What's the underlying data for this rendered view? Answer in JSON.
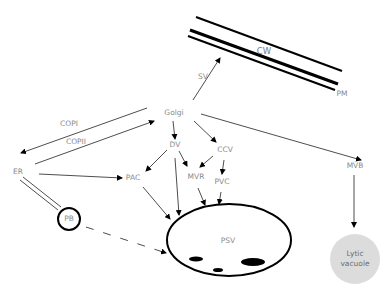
{
  "diagram": {
    "nodes": {
      "cw": "CW",
      "pm": "PM",
      "sv": "SV",
      "golgi": "Golgi",
      "copi": "COPI",
      "copii": "COPII",
      "er": "ER",
      "dv": "DV",
      "ccv": "CCV",
      "pac": "PAC",
      "mvr": "MVR",
      "pvc": "PVC",
      "mvb": "MVB",
      "pb": "PB",
      "psv": "PSV",
      "lytic_vacuole_line1": "Lytic",
      "lytic_vacuole_line2": "vacuole"
    },
    "edges": [
      {
        "from": "Golgi",
        "to": "CW/PM",
        "label": "SV",
        "style": "arrow"
      },
      {
        "from": "Golgi",
        "to": "ER",
        "label": "COPI",
        "style": "arrow"
      },
      {
        "from": "ER",
        "to": "Golgi",
        "label": "COPII",
        "style": "arrow"
      },
      {
        "from": "Golgi",
        "to": "DV",
        "style": "arrow"
      },
      {
        "from": "Golgi",
        "to": "CCV",
        "style": "arrow"
      },
      {
        "from": "Golgi",
        "to": "MVB",
        "style": "arrow"
      },
      {
        "from": "ER",
        "to": "PAC",
        "style": "arrow"
      },
      {
        "from": "DV",
        "to": "PAC",
        "style": "arrow"
      },
      {
        "from": "DV",
        "to": "MVR",
        "style": "arrow"
      },
      {
        "from": "DV",
        "to": "PSV",
        "style": "arrow"
      },
      {
        "from": "CCV",
        "to": "MVR",
        "style": "arrow"
      },
      {
        "from": "CCV",
        "to": "PVC",
        "style": "arrow"
      },
      {
        "from": "PAC",
        "to": "PSV",
        "style": "arrow"
      },
      {
        "from": "MVR",
        "to": "PSV",
        "style": "arrow"
      },
      {
        "from": "PVC",
        "to": "PSV",
        "style": "arrow"
      },
      {
        "from": "MVB",
        "to": "Lytic vacuole",
        "style": "arrow"
      },
      {
        "from": "ER",
        "to": "PB",
        "style": "double-line"
      },
      {
        "from": "PB",
        "to": "PSV",
        "style": "dashed-arrow"
      }
    ],
    "colors": {
      "line": "#000000",
      "label": "#8a8a8a",
      "lytic_vacuole_fill": "#dcdcdc"
    }
  }
}
